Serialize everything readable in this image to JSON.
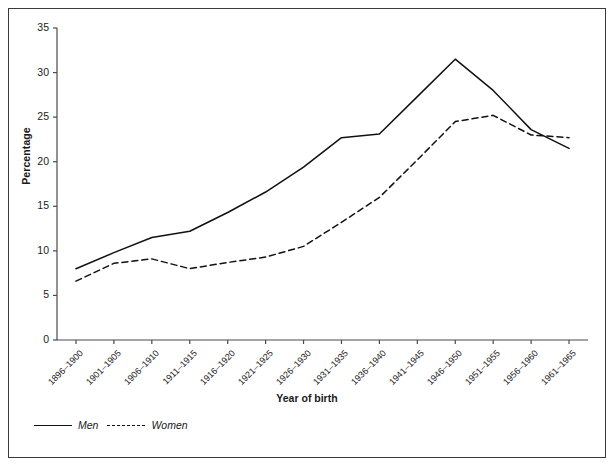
{
  "chart_data": {
    "type": "line",
    "title": "",
    "xlabel": "Year of birth",
    "ylabel": "Percentage",
    "categories": [
      "1896–1900",
      "1901–1905",
      "1906–1910",
      "1911–1915",
      "1916–1920",
      "1921–1925",
      "1926–1930",
      "1931–1935",
      "1936–1940",
      "1941–1945",
      "1946–1950",
      "1951–1955",
      "1956–1960",
      "1961–1965"
    ],
    "series": [
      {
        "name": "Men",
        "style": "solid",
        "values": [
          8.0,
          9.8,
          11.5,
          12.2,
          14.3,
          16.6,
          19.4,
          22.7,
          23.1,
          27.3,
          31.5,
          28.0,
          23.6,
          21.5
        ]
      },
      {
        "name": "Women",
        "style": "dashed",
        "values": [
          6.6,
          8.6,
          9.1,
          8.0,
          8.7,
          9.3,
          10.5,
          13.2,
          16.0,
          20.2,
          24.5,
          25.2,
          23.0,
          22.7
        ]
      }
    ],
    "ylim": [
      0,
      35
    ],
    "yticks": [
      0,
      5,
      10,
      15,
      20,
      25,
      30,
      35
    ],
    "grid": false,
    "legend_position": "below-left",
    "colors": {
      "men": "#111111",
      "women": "#111111",
      "axis": "#4a4a4a",
      "frame": "#3a3a3a"
    }
  }
}
